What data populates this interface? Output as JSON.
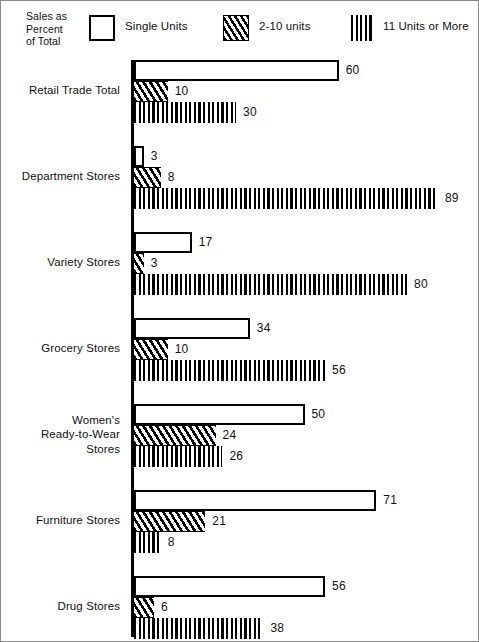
{
  "legend": {
    "title": "Sales as\nPercent\nof Total",
    "entries": [
      {
        "label": "Single Units",
        "icon": "legend-swatch-solid-outline"
      },
      {
        "label": "2-10 units",
        "icon": "legend-swatch-diagonal-hatch"
      },
      {
        "label": "11 Units or More",
        "icon": "legend-swatch-vertical-stripes"
      }
    ]
  },
  "chart_data": {
    "type": "bar",
    "orientation": "horizontal",
    "title": "",
    "subtitle": "",
    "xlabel": "",
    "ylabel": "",
    "value_unit": "percent",
    "xlim": [
      0,
      100
    ],
    "grid": false,
    "legend_position": "top",
    "axis_line": "left-vertical-baseline",
    "categories": [
      "Retail Trade Total",
      "Department Stores",
      "Variety Stores",
      "Grocery Stores",
      "Women's\nReady-to-Wear\nStores",
      "Furniture Stores",
      "Drug Stores"
    ],
    "series": [
      {
        "name": "Single Units",
        "values": [
          60,
          3,
          17,
          34,
          50,
          71,
          56
        ]
      },
      {
        "name": "2-10 units",
        "values": [
          10,
          8,
          3,
          10,
          24,
          21,
          6
        ]
      },
      {
        "name": "11 Units or More",
        "values": [
          30,
          89,
          80,
          56,
          26,
          8,
          38
        ]
      }
    ],
    "data_labels": [
      [
        "60",
        "10",
        "30"
      ],
      [
        "3",
        "8",
        "89"
      ],
      [
        "17",
        "3",
        "80"
      ],
      [
        "34",
        "10",
        "56"
      ],
      [
        "50",
        "24",
        "26"
      ],
      [
        "71",
        "21",
        "8"
      ],
      [
        "56",
        "6",
        "38"
      ]
    ]
  },
  "colors": {
    "ink": "#000000",
    "background": "#ffffff",
    "border": "#8a8a8a"
  }
}
